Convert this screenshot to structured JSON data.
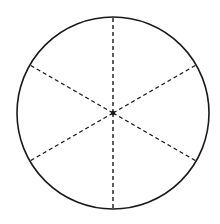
{
  "diagram": {
    "type": "circle-divided-into-sectors",
    "canvas": {
      "width": 220,
      "height": 224,
      "background": "#ffffff"
    },
    "circle": {
      "cx": 113,
      "cy": 113,
      "r": 96,
      "stroke": "#1a1a1a",
      "stroke_width": 1.6
    },
    "center_dot": {
      "r": 2.2,
      "fill": "#1a1a1a"
    },
    "spokes": {
      "count": 6,
      "angles_deg": [
        90,
        30,
        330,
        270,
        210,
        150
      ],
      "style": "dashed",
      "dash": "4 3",
      "stroke": "#1a1a1a",
      "stroke_width": 1.4
    },
    "sectors": 6
  }
}
